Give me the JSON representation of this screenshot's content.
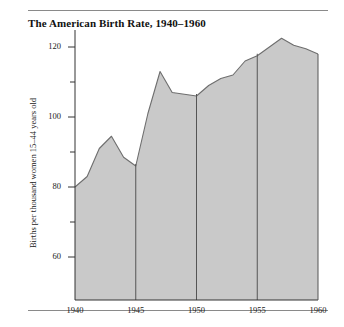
{
  "chart_data": {
    "type": "area",
    "title": "The American Birth Rate, 1940–1960",
    "xlabel": "",
    "ylabel": "Births per thousand women 15–44 years old",
    "xlim": [
      1940,
      1960
    ],
    "ylim": [
      50,
      126
    ],
    "grid": "vertical gridlines at 1945, 1950, 1955 and axis lines at 1940, 1960",
    "legend": "none",
    "fill_color": "#c9c9c9",
    "line_color": "#6e6e6e",
    "axis_color": "#333333",
    "x_major_ticks": [
      1940,
      1945,
      1950,
      1955,
      1960
    ],
    "x_tick_labels": [
      "1940",
      "1945",
      "1950",
      "1955",
      "1960"
    ],
    "y_major_ticks": [
      60,
      80,
      100,
      120
    ],
    "y_tick_labels": [
      "60",
      "80",
      "100",
      "120"
    ],
    "y_minor_ticks": [
      70,
      90,
      110
    ],
    "x": [
      1940,
      1941,
      1942,
      1943,
      1944,
      1945,
      1946,
      1947,
      1948,
      1949,
      1950,
      1951,
      1952,
      1953,
      1954,
      1955,
      1956,
      1957,
      1958,
      1959,
      1960
    ],
    "values": [
      80,
      83,
      91,
      94.5,
      88.5,
      86,
      101,
      113,
      107,
      106.5,
      106,
      109,
      111,
      112,
      116,
      117.5,
      120,
      122.5,
      120.5,
      119.5,
      118
    ],
    "annotations": []
  },
  "page": {
    "rule_top": "horizontal-rule",
    "rule_bottom": "horizontal-rule"
  }
}
